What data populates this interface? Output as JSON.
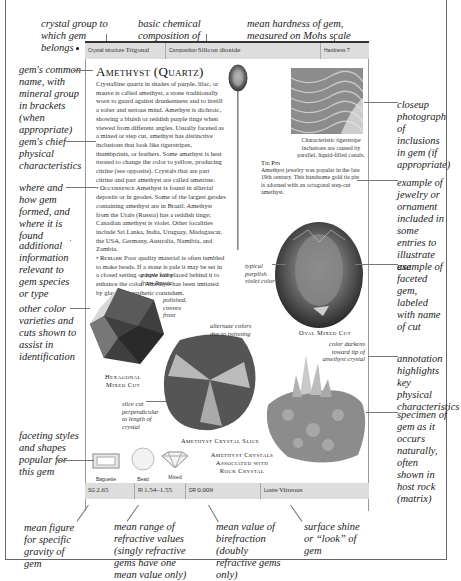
{
  "header_annotations": {
    "crystal_group": "crystal group to which gem belongs",
    "chemical_composition": "basic chemical composition of gem",
    "hardness": "mean hardness of gem, measured on Mohs scale"
  },
  "top_bar": {
    "crystal_structure_label": "Crystal structure",
    "crystal_structure_value": "Trigonal",
    "composition_label": "Composition",
    "composition_value": "Silicon dioxide",
    "hardness_label": "Hardness",
    "hardness_value": "7"
  },
  "entry": {
    "title": "Amethyst (Quartz)",
    "description": "Crystalline quartz in shades of purple, lilac, or mauve is called amethyst, a stone traditionally worn to guard against drunkenness and to instill a sober and serious mind. Amethyst is dichroic, showing a bluish or reddish purple tinge when viewed from different angles. Usually faceted as a mixed or step cut, amethyst has distinctive inclusions that look like tigerstripes, thumbprints, or feathers. Some amethyst is heat treated to change the color to yellow, producing citrine (see opposite). Crystals that are part citrine and part amethyst are called ametrine.",
    "occurrence_label": "Occurrence",
    "occurrence_text": "Amethyst is found in alluvial deposits or in geodes. Some of the largest geodes containing amethyst are in Brazil. Amethyst from the Urals (Russia) has a reddish tinge; Canadian amethyst is violet. Other localities include Sri Lanka, India, Uruguay, Madagascar, the USA, Germany, Australia, Namibia, and Zambia.",
    "remark_label": "Remark",
    "remark_text": "Poor quality material is often tumbled to make beads. If a stone is pale it may be set in a closed setting or have foil placed behind it to enhance the color. Amethyst has been imitated by glass and synthetic corundum."
  },
  "inclusion_photo": {
    "caption": "Characteristic tigerstripe inclusions are caused by parallel, liquid-filled canals."
  },
  "tie_pin": {
    "title": "Tie Pin",
    "text": "Amethyst jewelry was popular in the late 19th century. This handsome gold tie pin is adorned with an octagonal step-cut amethyst."
  },
  "gems": {
    "oval": {
      "caption": "Oval Mixed Cut",
      "note": "typical purplish violet color"
    },
    "hexagonal": {
      "caption_line1": "Hexagonal",
      "caption_line2": "Mixed Cut",
      "note_top": "purple stone from Russia",
      "note_side": "polished, convex front"
    },
    "slice": {
      "caption": "Amethyst Crystal Slice",
      "note_top": "alternate colors due to twinning",
      "note_side": "slice cut perpendicular to length of crystal"
    },
    "crystals": {
      "caption_line1": "Amethyst Crystals",
      "caption_line2": "Associated with",
      "caption_line3": "Rock Crystal",
      "note": "color darkens toward tip of amethyst crystal"
    }
  },
  "cuts": [
    {
      "label": "Baguette"
    },
    {
      "label": "Bead"
    },
    {
      "label": "Mixed"
    }
  ],
  "bottom_bar": {
    "sg_label": "SG",
    "sg_value": "2.65",
    "ri_label": "RI",
    "ri_value": "1.54–1.55",
    "dr_label": "DR",
    "dr_value": "0.009",
    "lustre_label": "Lustre",
    "lustre_value": "Vitreous"
  },
  "left_annotations": {
    "common_name": "gem's common name, with mineral group in brackets (when appropriate)",
    "physical": "gem's chief physical characteristics",
    "occurrence": "where and how gem formed, and where it is found",
    "additional": "additional information relevant to gem species or type",
    "varieties": "other color varieties and cuts shown to assist in identification",
    "faceting": "faceting styles and shapes popular for this gem"
  },
  "right_annotations": {
    "closeup": "closeup photograph of inclusions in gem (if appropriate)",
    "jewelry": "example of jewelry or ornament included in some entries to illustrate use",
    "faceted": "example of faceted gem, labeled with name of cut",
    "annotation": "annotation highlights key physical characteristics",
    "specimen": "specimen of gem as it occurs naturally, often shown in host rock (matrix)"
  },
  "bottom_annotations": {
    "sg": "mean figure for specific gravity of gem",
    "ri": "mean range of refractive values (singly refractive gems have one mean value only)",
    "dr": "mean value of birefraction (doubly refractive gems only)",
    "lustre": "surface shine or “look” of gem"
  }
}
